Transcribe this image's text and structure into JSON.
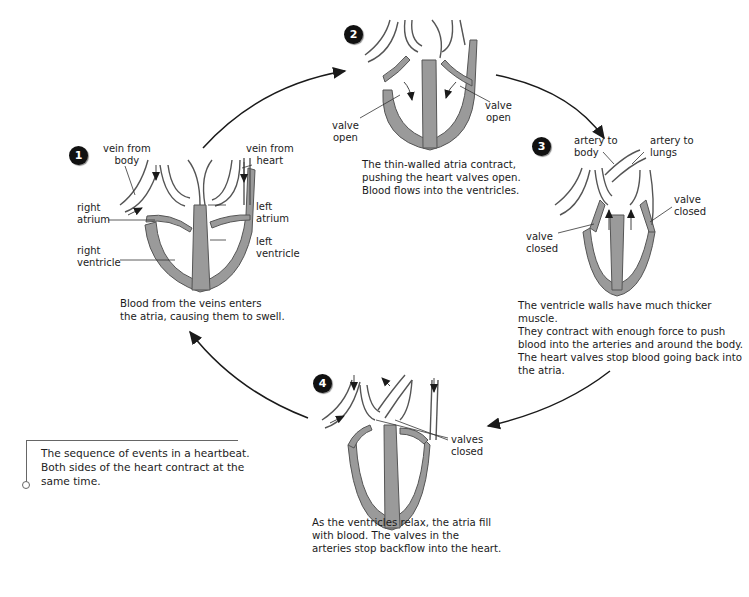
{
  "stages": [
    {
      "number": "1",
      "labels": {
        "vein_body": [
          "vein from",
          "body"
        ],
        "vein_heart": [
          "vein from",
          "heart"
        ],
        "right_atrium": [
          "right",
          "atrium"
        ],
        "left_atrium": [
          "left",
          "atrium"
        ],
        "right_ventricle": [
          "right",
          "ventricle"
        ],
        "left_ventricle": [
          "left",
          "ventricle"
        ]
      },
      "caption": [
        "Blood from the veins enters",
        "the atria, causing them to swell."
      ]
    },
    {
      "number": "2",
      "labels": {
        "valve_left": [
          "valve",
          "open"
        ],
        "valve_right": [
          "valve",
          "open"
        ]
      },
      "caption": [
        "The thin-walled atria contract,",
        "pushing the heart valves open.",
        "Blood flows into the ventricles."
      ]
    },
    {
      "number": "3",
      "labels": {
        "artery_body": [
          "artery to",
          "body"
        ],
        "artery_lungs": [
          "artery to",
          "lungs"
        ],
        "valve_right": [
          "valve",
          "closed"
        ],
        "valve_left": [
          "valve",
          "closed"
        ]
      },
      "caption": [
        "The ventricle walls have much thicker muscle.",
        "They contract with enough force to push",
        "blood into the arteries and around the body.",
        "The heart valves stop blood going back into",
        "the atria."
      ]
    },
    {
      "number": "4",
      "labels": {
        "valves": [
          "valves",
          "closed"
        ]
      },
      "caption": [
        "As the ventricles relax, the atria fill",
        "with blood. The valves in the",
        "arteries stop backflow into the heart."
      ]
    }
  ],
  "note": {
    "text": [
      "The sequence of events in a heartbeat.",
      "Both sides of the heart contract at the",
      "same time."
    ]
  },
  "colors": {
    "muscle": "#9a9a9a",
    "outline": "#555555",
    "badge": "#111111",
    "arrow": "#1a1a1a"
  }
}
